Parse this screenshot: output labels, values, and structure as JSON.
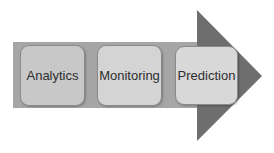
{
  "diagram": {
    "type": "process-arrow",
    "colors": {
      "band": "#a6a6a6",
      "head": "#6e6e6e",
      "box_1": "#c8c8c8",
      "box_2": "#d4d4d4",
      "box_3": "#d8d8d8"
    },
    "steps": [
      {
        "label": "Analytics"
      },
      {
        "label": "Monitoring"
      },
      {
        "label": "Prediction"
      }
    ]
  }
}
